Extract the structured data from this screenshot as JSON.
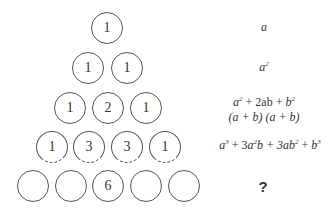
{
  "pascal_triangle": {
    "rows": [
      [
        "1"
      ],
      [
        "1",
        "1"
      ],
      [
        "1",
        "2",
        "1"
      ],
      [
        "1",
        "3",
        "3",
        "1"
      ],
      [
        "",
        "",
        "6",
        "",
        ""
      ]
    ]
  },
  "expressions": {
    "row1": "a",
    "row2_base": "a",
    "row2_exp": "2",
    "row3_line1": [
      "a",
      "2",
      " + 2ab + ",
      "b",
      "2"
    ],
    "row3_line2": "(a + b) (a + b)",
    "row4": [
      "a",
      "3",
      " + 3",
      "a",
      "2",
      "b + 3",
      "ab",
      "2",
      " + ",
      "b",
      "3"
    ],
    "row5": "?"
  }
}
